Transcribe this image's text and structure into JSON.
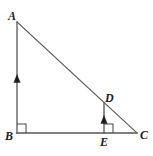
{
  "figure": {
    "kind": "geometry-diagram",
    "background_color": "#ffffff",
    "line_color": "#4a4a4a",
    "label_color": "#1c1c1c",
    "tick_color": "#1d1d1d"
  },
  "vertices": {
    "A": {
      "label": "A",
      "x": 17,
      "y": 22
    },
    "B": {
      "label": "B",
      "x": 17,
      "y": 133
    },
    "C": {
      "label": "C",
      "x": 137,
      "y": 133
    },
    "D": {
      "label": "D",
      "x": 104,
      "y": 103
    },
    "E": {
      "label": "E",
      "x": 104,
      "y": 133
    }
  },
  "segments": [
    {
      "name": "AB",
      "from": "A",
      "to": "B",
      "style": "leg"
    },
    {
      "name": "BC",
      "from": "B",
      "to": "C",
      "style": "leg"
    },
    {
      "name": "AC",
      "from": "A",
      "to": "C",
      "style": "hypotenuse"
    },
    {
      "name": "DE",
      "from": "D",
      "to": "E",
      "style": "leg"
    }
  ],
  "right_angles": [
    {
      "name": "angle-B",
      "at": "B",
      "size": 9
    },
    {
      "name": "angle-DEC",
      "at": "E",
      "size": 9
    }
  ],
  "tick_marks": [
    {
      "name": "tick-AB",
      "on": "AB",
      "x": 17,
      "y": 80,
      "direction": "up"
    },
    {
      "name": "tick-DE",
      "on": "DE",
      "x": 104,
      "y": 121,
      "direction": "up"
    }
  ]
}
